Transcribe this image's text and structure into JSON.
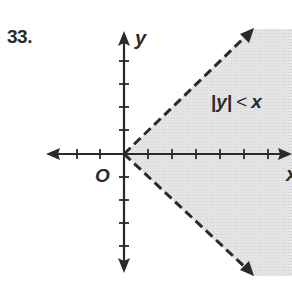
{
  "problem": {
    "number": "33."
  },
  "graph": {
    "x_axis_label": "x",
    "y_axis_label": "y",
    "origin_label": "O",
    "inequality": {
      "abs_open": "|",
      "var_y": "y",
      "abs_close": "|",
      "relation": "<",
      "var_x": "x",
      "text": "|y| < x"
    },
    "boundary_style": "dashed",
    "shading_color": "#e2e2e2",
    "axis_color": "#2a2a2a"
  }
}
